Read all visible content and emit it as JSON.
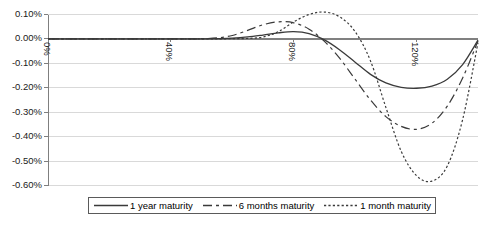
{
  "chart_data": {
    "type": "line",
    "title": "",
    "xlabel": "",
    "ylabel": "",
    "xlim": [
      0,
      140
    ],
    "ylim": [
      -0.6,
      0.1
    ],
    "grid": true,
    "legend_position": "bottom",
    "y_ticks": [
      "0.10%",
      "0.00%",
      "-0.10%",
      "-0.20%",
      "-0.30%",
      "-0.40%",
      "-0.50%",
      "-0.60%"
    ],
    "y_tick_values": [
      0.1,
      0.0,
      -0.1,
      -0.2,
      -0.3,
      -0.4,
      -0.5,
      -0.6
    ],
    "x_ticks": [
      "0%",
      "40%",
      "80%",
      "120%"
    ],
    "x_tick_values": [
      0,
      40,
      80,
      120
    ],
    "x": [
      0,
      5,
      10,
      15,
      20,
      25,
      30,
      35,
      40,
      45,
      50,
      55,
      60,
      65,
      70,
      75,
      80,
      85,
      90,
      95,
      100,
      105,
      110,
      115,
      120,
      125,
      130,
      135,
      140
    ],
    "series": [
      {
        "name": "1 year maturity",
        "style": "solid",
        "color": "#3a3a3a",
        "values": [
          0.0,
          0.0,
          0.0,
          0.0,
          0.0,
          0.0,
          0.0,
          0.0,
          0.0,
          0.0,
          0.0,
          0.001,
          0.003,
          0.008,
          0.016,
          0.025,
          0.03,
          0.022,
          -0.004,
          -0.045,
          -0.095,
          -0.145,
          -0.18,
          -0.198,
          -0.202,
          -0.193,
          -0.165,
          -0.105,
          -0.005
        ]
      },
      {
        "name": "6 months maturity",
        "style": "dashed",
        "color": "#3a3a3a",
        "values": [
          0.0,
          0.0,
          0.0,
          0.0,
          0.0,
          0.0,
          0.0,
          0.0,
          0.0,
          0.0,
          0.001,
          0.004,
          0.014,
          0.035,
          0.058,
          0.07,
          0.066,
          0.04,
          -0.01,
          -0.08,
          -0.165,
          -0.25,
          -0.318,
          -0.358,
          -0.37,
          -0.345,
          -0.275,
          -0.16,
          -0.008
        ]
      },
      {
        "name": "1 month maturity",
        "style": "dotted",
        "color": "#3a3a3a",
        "values": [
          0.0,
          0.0,
          0.0,
          0.0,
          0.0,
          0.0,
          0.0,
          0.0,
          0.0,
          0.0,
          0.0,
          0.0,
          0.001,
          0.002,
          0.008,
          0.03,
          0.07,
          0.1,
          0.11,
          0.09,
          0.03,
          -0.09,
          -0.28,
          -0.46,
          -0.56,
          -0.582,
          -0.52,
          -0.33,
          -0.015
        ]
      }
    ]
  },
  "legend": {
    "items": [
      {
        "label": "1 year maturity",
        "style": "solid"
      },
      {
        "label": "6 months maturity",
        "style": "dashed"
      },
      {
        "label": "1 month maturity",
        "style": "dotted"
      }
    ]
  },
  "colors": {
    "grid": "#d9d9d9",
    "axis": "#7f7f7f",
    "zero_line": "#808080",
    "series": "#3a3a3a",
    "legend_border": "#5a5a5a"
  }
}
